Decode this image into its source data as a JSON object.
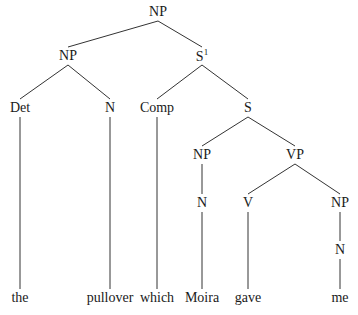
{
  "diagram": {
    "type": "syntax-tree",
    "nodes": [
      {
        "id": "np0",
        "label": "NP"
      },
      {
        "id": "np1",
        "label": "NP"
      },
      {
        "id": "sbar",
        "label": "S",
        "sup": "1"
      },
      {
        "id": "det",
        "label": "Det"
      },
      {
        "id": "n1",
        "label": "N"
      },
      {
        "id": "comp",
        "label": "Comp"
      },
      {
        "id": "s",
        "label": "S"
      },
      {
        "id": "np2",
        "label": "NP"
      },
      {
        "id": "vp",
        "label": "VP"
      },
      {
        "id": "n2",
        "label": "N"
      },
      {
        "id": "v",
        "label": "V"
      },
      {
        "id": "np3",
        "label": "NP"
      },
      {
        "id": "n3",
        "label": "N"
      },
      {
        "id": "w_the",
        "label": "the"
      },
      {
        "id": "w_pullover",
        "label": "pullover"
      },
      {
        "id": "w_which",
        "label": "which"
      },
      {
        "id": "w_moira",
        "label": "Moira"
      },
      {
        "id": "w_gave",
        "label": "gave"
      },
      {
        "id": "w_me",
        "label": "me"
      }
    ],
    "edges": [
      [
        "np0",
        "np1"
      ],
      [
        "np0",
        "sbar"
      ],
      [
        "np1",
        "det"
      ],
      [
        "np1",
        "n1"
      ],
      [
        "sbar",
        "comp"
      ],
      [
        "sbar",
        "s"
      ],
      [
        "s",
        "np2"
      ],
      [
        "s",
        "vp"
      ],
      [
        "np2",
        "n2"
      ],
      [
        "vp",
        "v"
      ],
      [
        "vp",
        "np3"
      ],
      [
        "np3",
        "n3"
      ],
      [
        "det",
        "w_the"
      ],
      [
        "n1",
        "w_pullover"
      ],
      [
        "comp",
        "w_which"
      ],
      [
        "n2",
        "w_moira"
      ],
      [
        "v",
        "w_gave"
      ],
      [
        "n3",
        "w_me"
      ]
    ]
  }
}
